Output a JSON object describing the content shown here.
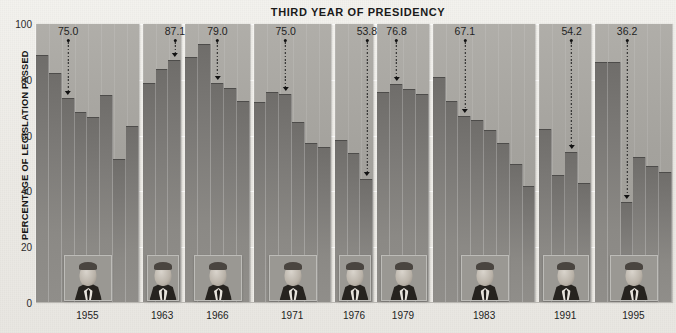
{
  "chart_data": {
    "type": "bar",
    "title": "THIRD YEAR OF PRESIDENCY",
    "xlabel": "",
    "ylabel": "PERCENTAGE OF LEGISLATION PASSED",
    "ylim": [
      0,
      100
    ],
    "yticks": [
      0,
      20,
      40,
      60,
      80,
      100
    ],
    "grid": true,
    "legend": "none",
    "categories": [
      "1955",
      "1963",
      "1966",
      "1971",
      "1976",
      "1979",
      "1983",
      "1991",
      "1995"
    ],
    "groups": [
      {
        "label": "1955",
        "president": "Eisenhower",
        "third_year_value": 75.0,
        "third_year_index": 2,
        "values": [
          89.0,
          82.5,
          73.5,
          68.5,
          66.5,
          74.5,
          51.5,
          63.5
        ]
      },
      {
        "label": "1963",
        "president": "Kennedy",
        "third_year_value": 87.1,
        "third_year_index": 2,
        "values": [
          79.0,
          84.0,
          87.1
        ]
      },
      {
        "label": "1966",
        "president": "Johnson",
        "third_year_value": 79.0,
        "third_year_index": 2,
        "values": [
          88.0,
          93.0,
          79.0,
          77.0,
          72.5
        ]
      },
      {
        "label": "1971",
        "president": "Nixon",
        "third_year_value": 75.0,
        "third_year_index": 2,
        "values": [
          72.0,
          75.5,
          75.0,
          65.0,
          57.5,
          56.0
        ]
      },
      {
        "label": "1976",
        "president": "Ford",
        "third_year_value": 53.8,
        "third_year_index": 2,
        "values": [
          58.5,
          53.8,
          44.5
        ]
      },
      {
        "label": "1979",
        "president": "Carter",
        "third_year_value": 76.8,
        "third_year_index": 1,
        "values": [
          75.5,
          78.5,
          76.8,
          75.0
        ]
      },
      {
        "label": "1983",
        "president": "Reagan",
        "third_year_value": 67.1,
        "third_year_index": 2,
        "values": [
          81.0,
          72.5,
          67.1,
          65.5,
          62.0,
          57.5,
          50.0,
          42.0
        ]
      },
      {
        "label": "1991",
        "president": "Bush",
        "third_year_value": 54.2,
        "third_year_index": 2,
        "values": [
          62.5,
          46.0,
          54.2,
          43.0
        ]
      },
      {
        "label": "1995",
        "president": "Clinton",
        "third_year_value": 36.2,
        "third_year_index": 2,
        "values": [
          86.5,
          86.5,
          36.2,
          52.5,
          49.0,
          47.0
        ]
      }
    ],
    "annotations": [
      {
        "value": "75.0"
      },
      {
        "value": "87.1"
      },
      {
        "value": "79.0"
      },
      {
        "value": "75.0"
      },
      {
        "value": "53.8"
      },
      {
        "value": "76.8"
      },
      {
        "value": "67.1"
      },
      {
        "value": "54.2"
      },
      {
        "value": "36.2"
      }
    ]
  }
}
